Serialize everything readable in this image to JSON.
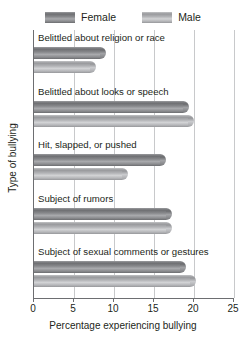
{
  "legend": {
    "entries": [
      {
        "label": "Female",
        "swatch_name": "legend-swatch-female",
        "color": "#7b7c7f"
      },
      {
        "label": "Male",
        "swatch_name": "legend-swatch-male",
        "color": "#b0b1b4"
      }
    ]
  },
  "axes": {
    "x_title": "Percentage experiencing bullying",
    "y_title": "Type of bullying",
    "x_ticks": [
      "0",
      "5",
      "10",
      "15",
      "20",
      "25"
    ]
  },
  "chart_data": {
    "type": "bar",
    "orientation": "horizontal",
    "title": "",
    "xlabel": "Percentage experiencing bullying",
    "ylabel": "Type of bullying",
    "xlim": [
      0,
      25
    ],
    "xticks": [
      0,
      5,
      10,
      15,
      20,
      25
    ],
    "grid": true,
    "legend_position": "top-center",
    "categories": [
      "Belittled about religion or race",
      "Belittled about looks or speech",
      "Hit, slapped, or pushed",
      "Subject of rumors",
      "Subject of sexual comments or gestures"
    ],
    "series": [
      {
        "name": "Female",
        "color": "#7b7c7f",
        "values": [
          9.0,
          19.4,
          16.5,
          17.3,
          19.0
        ]
      },
      {
        "name": "Male",
        "color": "#b0b1b4",
        "values": [
          7.8,
          20.0,
          11.8,
          17.3,
          20.3
        ]
      }
    ]
  }
}
